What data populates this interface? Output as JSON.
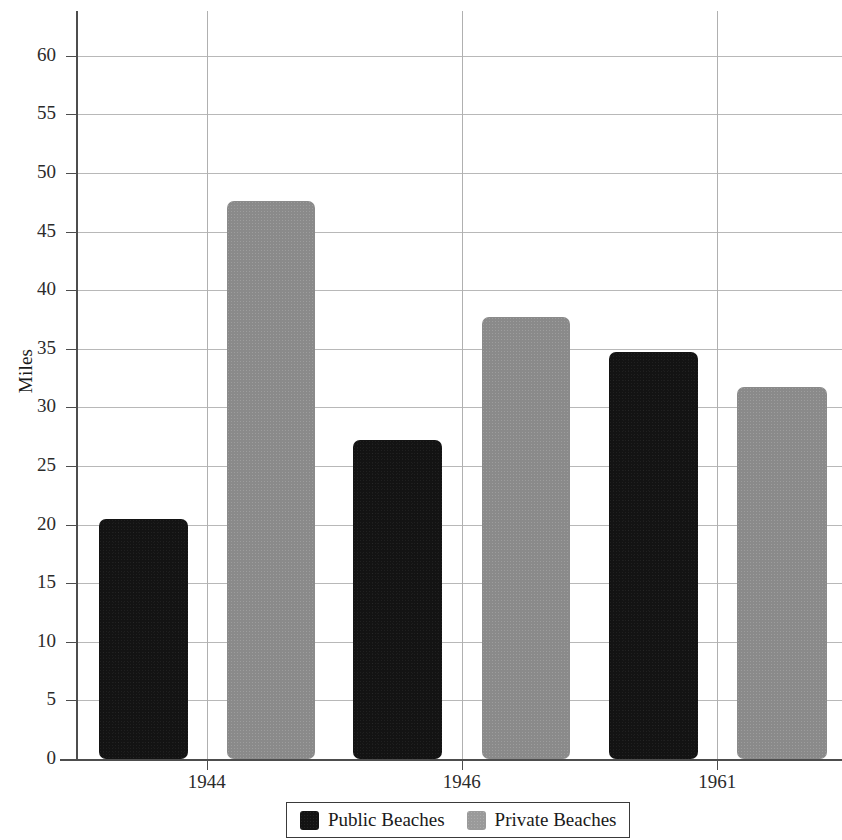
{
  "chart_data": {
    "type": "bar",
    "title": "",
    "subtitle": "",
    "xlabel": "",
    "ylabel": "Miles",
    "categories": [
      "1944",
      "1946",
      "1961"
    ],
    "series": [
      {
        "name": "Public Beaches",
        "color": "#131313",
        "values": [
          20.5,
          27.2,
          34.7
        ]
      },
      {
        "name": "Private Beaches",
        "color": "#8a8a8a",
        "values": [
          47.6,
          37.7,
          31.7
        ]
      }
    ],
    "ylim": [
      0,
      63
    ],
    "yticks": [
      0,
      5,
      10,
      15,
      20,
      25,
      30,
      35,
      40,
      45,
      50,
      55,
      60
    ],
    "ytick_labels": [
      "0",
      "5",
      "10",
      "15",
      "20",
      "25",
      "30",
      "35",
      "40",
      "45",
      "50",
      "55",
      "60"
    ],
    "grid": {
      "horizontal": true,
      "vertical": true
    },
    "legend": {
      "position": "bottom",
      "entries": [
        "Public Beaches",
        "Private Beaches"
      ]
    },
    "annotations": []
  },
  "axis": {
    "y_title": "Miles"
  },
  "legend": {
    "items": [
      {
        "label": "Public Beaches"
      },
      {
        "label": "Private Beaches"
      }
    ]
  }
}
